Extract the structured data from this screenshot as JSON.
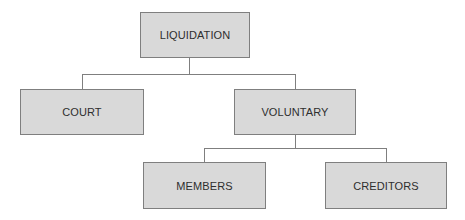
{
  "diagram": {
    "type": "hierarchy-tree",
    "colors": {
      "node_fill": "#d9d9d9",
      "node_border": "#7f7f7f",
      "connector": "#7f7f7f",
      "text": "#2e2e2e"
    },
    "nodes": {
      "root": {
        "label": "LIQUIDATION"
      },
      "court": {
        "label": "COURT"
      },
      "voluntary": {
        "label": "VOLUNTARY"
      },
      "members": {
        "label": "MEMBERS"
      },
      "creditors": {
        "label": "CREDITORS"
      }
    },
    "edges": [
      {
        "from": "LIQUIDATION",
        "to": "COURT"
      },
      {
        "from": "LIQUIDATION",
        "to": "VOLUNTARY"
      },
      {
        "from": "VOLUNTARY",
        "to": "MEMBERS"
      },
      {
        "from": "VOLUNTARY",
        "to": "CREDITORS"
      }
    ]
  }
}
